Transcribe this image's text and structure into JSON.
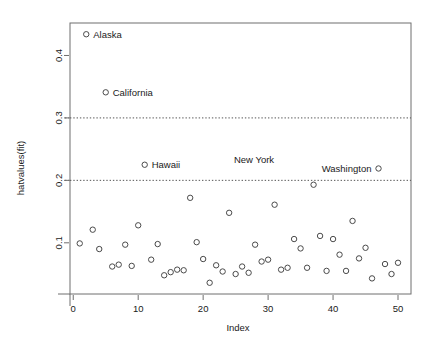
{
  "chart_data": {
    "type": "scatter",
    "title": "",
    "xlabel": "Index",
    "ylabel": "hatvalues(fit)",
    "xlim": [
      -0.5,
      52.0
    ],
    "ylim": [
      0.018,
      0.452
    ],
    "xticks": [
      0,
      10,
      20,
      30,
      40,
      50
    ],
    "xticklabels": [
      "0",
      "10",
      "20",
      "30",
      "40",
      "50"
    ],
    "yticks": [
      0.1,
      0.2,
      0.3,
      0.4
    ],
    "yticklabels": [
      "0.1",
      "0.2",
      "0.3",
      "0.4"
    ],
    "grid": false,
    "legend": "none",
    "marker": "open-circle",
    "reference_lines": [
      {
        "value": 0.2,
        "style": "dashed",
        "orientation": "horizontal"
      },
      {
        "value": 0.3,
        "style": "dashed",
        "orientation": "horizontal"
      }
    ],
    "x": [
      1,
      2,
      3,
      4,
      5,
      6,
      7,
      8,
      9,
      10,
      11,
      12,
      13,
      14,
      15,
      16,
      17,
      18,
      19,
      20,
      21,
      22,
      23,
      24,
      25,
      26,
      27,
      28,
      29,
      30,
      31,
      32,
      33,
      34,
      35,
      36,
      37,
      38,
      39,
      40,
      41,
      42,
      43,
      44,
      45,
      46,
      47,
      48,
      49,
      50
    ],
    "values": [
      0.099,
      0.434,
      0.121,
      0.09,
      0.341,
      0.062,
      0.065,
      0.097,
      0.063,
      0.128,
      0.225,
      0.073,
      0.098,
      0.048,
      0.053,
      0.057,
      0.056,
      0.172,
      0.101,
      0.074,
      0.036,
      0.064,
      0.054,
      0.148,
      0.05,
      0.062,
      0.052,
      0.097,
      0.07,
      0.073,
      0.161,
      0.057,
      0.06,
      0.106,
      0.091,
      0.06,
      0.193,
      0.111,
      0.055,
      0.106,
      0.081,
      0.055,
      0.135,
      0.075,
      0.092,
      0.043,
      0.219,
      0.066,
      0.05,
      0.068
    ],
    "annotations": [
      {
        "label": "Alaska",
        "x": 2,
        "y": 0.434,
        "label_side": "right"
      },
      {
        "label": "California",
        "x": 5,
        "y": 0.341,
        "label_side": "right"
      },
      {
        "label": "Hawaii",
        "x": 11,
        "y": 0.225,
        "label_side": "right"
      },
      {
        "label": "New York",
        "x": 32,
        "y": 0.234,
        "label_side": "left"
      },
      {
        "label": "Washington",
        "x": 47,
        "y": 0.219,
        "label_side": "left"
      }
    ]
  }
}
